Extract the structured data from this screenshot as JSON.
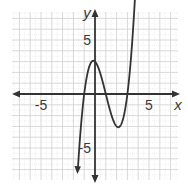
{
  "chart_data": {
    "type": "line",
    "title": "",
    "xlabel": "x",
    "ylabel": "y",
    "xlim": [
      -7.7,
      7.7
    ],
    "ylim": [
      -7.7,
      7.7
    ],
    "grid": true,
    "x_tick_labels": [
      {
        "value": -5,
        "label": "-5"
      },
      {
        "value": 5,
        "label": "5"
      }
    ],
    "y_tick_labels": [
      {
        "value": 5,
        "label": "5"
      },
      {
        "value": -5,
        "label": "-5"
      }
    ],
    "series": [
      {
        "name": "f(x)",
        "equation": "y = x^3 - 3x^2 - x + 3",
        "key_points": [
          {
            "x": -1,
            "y": 0,
            "note": "x-intercept"
          },
          {
            "x": 0,
            "y": 3,
            "note": "local maximum / y-intercept"
          },
          {
            "x": 1,
            "y": 0,
            "note": "x-intercept"
          },
          {
            "x": 2,
            "y": -3,
            "note": "local minimum"
          },
          {
            "x": 3,
            "y": 0,
            "note": "x-intercept"
          }
        ],
        "x": [
          -1.45,
          -1.25,
          -1.0,
          -0.75,
          -0.5,
          -0.25,
          0,
          0.25,
          0.5,
          0.75,
          1.0,
          1.25,
          1.5,
          1.75,
          2.0,
          2.25,
          2.5,
          2.75,
          3.0,
          3.25,
          3.5,
          3.75,
          4.0,
          4.1
        ],
        "y": [
          -4.05,
          -1.77,
          0,
          1.31,
          2.2,
          2.58,
          3,
          2.95,
          2.62,
          2.11,
          0,
          -0.7,
          -1.875,
          -2.58,
          -3,
          -2.95,
          -2.6,
          -1.55,
          0,
          1.3,
          3.13,
          5.0,
          7.0,
          8.14
        ]
      }
    ],
    "arrows": {
      "x_axis": "both-ends",
      "y_axis": "both-ends",
      "curve": "both-ends"
    },
    "colors": {
      "grid": "#cfcfcf",
      "axis": "#333333",
      "curve": "#333333"
    }
  }
}
